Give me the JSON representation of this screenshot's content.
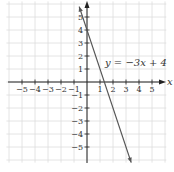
{
  "chart_data": {
    "type": "line",
    "title": "",
    "xlabel": "x",
    "ylabel": "y",
    "xlim": [
      -6,
      6
    ],
    "ylim": [
      -6,
      6
    ],
    "grid": true,
    "x_ticks": [
      -5,
      -4,
      -3,
      -2,
      -1,
      1,
      2,
      3,
      4,
      5
    ],
    "y_ticks": [
      -5,
      -4,
      -3,
      -2,
      -1,
      1,
      2,
      3,
      4,
      5
    ],
    "x_tick_labels": [
      "−5",
      "−4",
      "−3",
      "−2",
      "−1",
      "1",
      "2",
      "3",
      "4",
      "5"
    ],
    "y_tick_labels": [
      "−5",
      "−4",
      "−3",
      "−2",
      "−1",
      "1",
      "2",
      "3",
      "4",
      "5"
    ],
    "series": [
      {
        "name": "y = −3x + 4",
        "equation": "y = −3x + 4",
        "slope": -3,
        "intercept": 4,
        "x": [
          -0.6,
          3.4
        ],
        "y": [
          5.8,
          -6.2
        ]
      }
    ],
    "annotations": [
      {
        "text": "y = −3x + 4",
        "x": 1.7,
        "y": 2.1
      }
    ],
    "colors": {
      "line": "#555555",
      "axis": "#222222",
      "grid": "#dddddd"
    }
  },
  "labels": {
    "x_axis": "x",
    "equation": "y = −3x + 4"
  }
}
